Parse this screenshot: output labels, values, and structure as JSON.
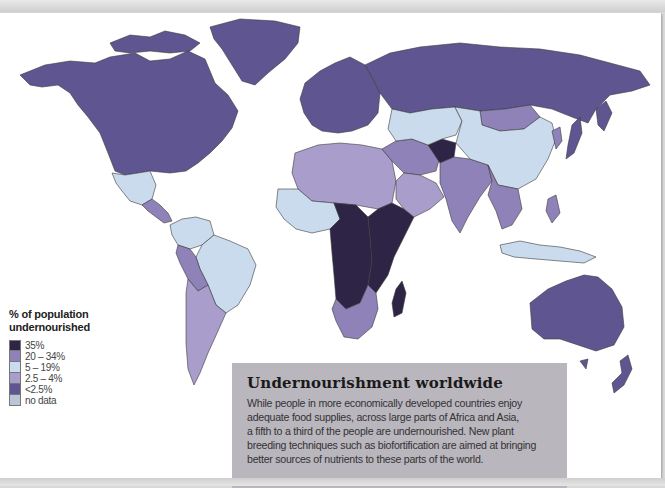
{
  "map": {
    "title": "Undernourishment worldwide",
    "description_lines": [
      "While people in more economically developed countries enjoy",
      "adequate food supplies, across large parts of Africa and Asia,",
      "a fifth to a third of the people are undernourished. New plant",
      "breeding techniques such as biofortification are aimed at bringing",
      "better sources of nutrients to these parts of the world."
    ],
    "legend": {
      "title_line1": "% of population",
      "title_line2": "undernourished",
      "items": [
        {
          "label": "35%",
          "color": "#2e2446"
        },
        {
          "label": "20 – 34%",
          "color": "#8f82b8"
        },
        {
          "label": "5 – 19%",
          "color": "#c9dbec"
        },
        {
          "label": "2.5 – 4%",
          "color": "#a99dcc"
        },
        {
          "label": "<2.5%",
          "color": "#5f5590"
        },
        {
          "label": "no data",
          "color": "#b8c6d8"
        }
      ]
    },
    "regions": [
      {
        "name": "north-america",
        "class": "<2.5%"
      },
      {
        "name": "greenland",
        "class": "<2.5%"
      },
      {
        "name": "mexico",
        "class": "5 – 19%"
      },
      {
        "name": "central-america",
        "class": "20 – 34%"
      },
      {
        "name": "south-america-north",
        "class": "5 – 19%"
      },
      {
        "name": "brazil",
        "class": "5 – 19%"
      },
      {
        "name": "bolivia",
        "class": "20 – 34%"
      },
      {
        "name": "argentina",
        "class": "2.5 – 4%"
      },
      {
        "name": "europe",
        "class": "<2.5%"
      },
      {
        "name": "russia",
        "class": "<2.5%"
      },
      {
        "name": "north-africa",
        "class": "2.5 – 4%"
      },
      {
        "name": "west-africa",
        "class": "5 – 19%"
      },
      {
        "name": "central-africa",
        "class": "35%"
      },
      {
        "name": "east-africa",
        "class": "35%"
      },
      {
        "name": "southern-africa",
        "class": "20 – 34%"
      },
      {
        "name": "madagascar",
        "class": "35%"
      },
      {
        "name": "middle-east",
        "class": "20 – 34%"
      },
      {
        "name": "arabia",
        "class": "2.5 – 4%"
      },
      {
        "name": "afghanistan",
        "class": "35%"
      },
      {
        "name": "central-asia",
        "class": "5 – 19%"
      },
      {
        "name": "india",
        "class": "20 – 34%"
      },
      {
        "name": "china",
        "class": "5 – 19%"
      },
      {
        "name": "mongolia",
        "class": "20 – 34%"
      },
      {
        "name": "southeast-asia",
        "class": "20 – 34%"
      },
      {
        "name": "indonesia",
        "class": "5 – 19%"
      },
      {
        "name": "japan",
        "class": "<2.5%"
      },
      {
        "name": "australia",
        "class": "<2.5%"
      },
      {
        "name": "new-zealand",
        "class": "<2.5%"
      }
    ]
  }
}
